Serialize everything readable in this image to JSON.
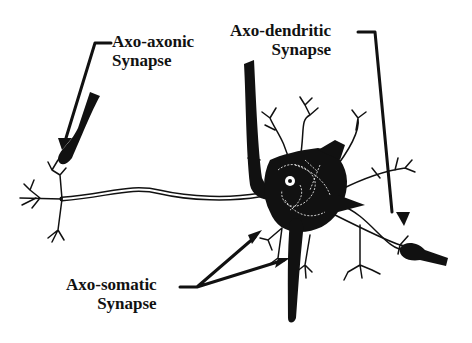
{
  "diagram": {
    "type": "neuron-synapse-types",
    "colors": {
      "ink": "#111111",
      "background": "#ffffff",
      "highlight": "#ffffff"
    },
    "labels": {
      "axo_axonic": {
        "line1": "Axo-axonic",
        "line2": "Synapse"
      },
      "axo_dendritic": {
        "line1": "Axo-dendritic",
        "line2": "Synapse"
      },
      "axo_somatic": {
        "line1": "Axo-somatic",
        "line2": "Synapse"
      }
    },
    "components": [
      "neuron-cell-body",
      "nucleus",
      "dendrites",
      "myelinated-axon",
      "axon-terminals",
      "presynaptic-axons"
    ]
  }
}
